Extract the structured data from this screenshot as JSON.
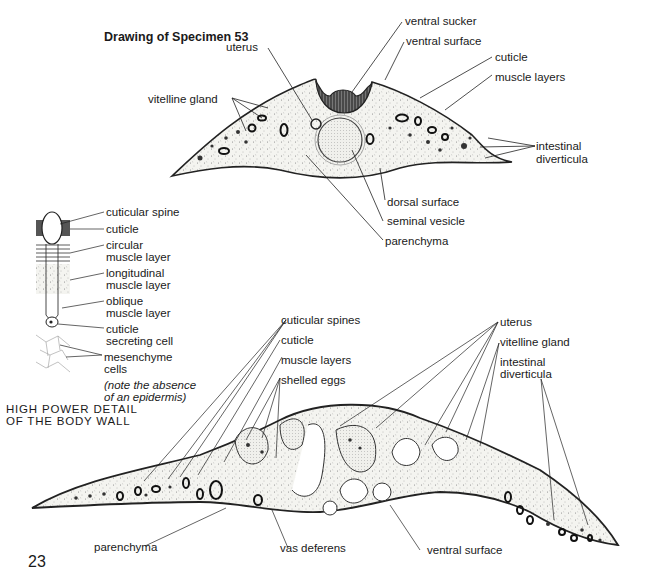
{
  "title": "Drawing of Specimen 53",
  "page_number": "23",
  "cross_section": {
    "labels": {
      "ventral_sucker": "ventral sucker",
      "ventral_surface": "ventral surface",
      "uterus": "uterus",
      "cuticle": "cuticle",
      "muscle_layers": "muscle layers",
      "vitelline_gland": "vitelline gland",
      "intestinal_1": "intestinal",
      "intestinal_2": "diverticula",
      "dorsal_surface": "dorsal surface",
      "seminal_vesicle": "seminal vesicle",
      "parenchyma": "parenchyma"
    }
  },
  "body_wall_detail": {
    "labels": {
      "cuticular_spine": "cuticular spine",
      "cuticle": "cuticle",
      "circular_1": "circular",
      "circular_2": "muscle layer",
      "longitudinal_1": "longitudinal",
      "longitudinal_2": "muscle layer",
      "oblique_1": "oblique",
      "oblique_2": "muscle layer",
      "secreting_1": "cuticle",
      "secreting_2": "secreting cell",
      "mesenchyme_1": "mesenchyme",
      "mesenchyme_2": "cells",
      "note_1": "(note the absence",
      "note_2": "of an epidermis)"
    },
    "caption_1": "HIGH POWER DETAIL",
    "caption_2": "OF THE BODY WALL"
  },
  "longitudinal_section": {
    "labels": {
      "cuticular_spines": "cuticular spines",
      "cuticle": "cuticle",
      "muscle_layers": "muscle layers",
      "shelled_eggs": "shelled eggs",
      "uterus": "uterus",
      "vitelline_gland": "vitelline gland",
      "intestinal_1": "intestinal",
      "intestinal_2": "diverticula",
      "parenchyma": "parenchyma",
      "vas_deferens": "vas deferens",
      "ventral_surface": "ventral surface"
    }
  }
}
